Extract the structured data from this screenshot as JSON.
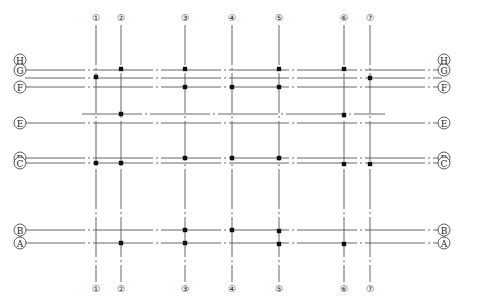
{
  "drawing": {
    "type": "structural grid axis plan",
    "colors": {
      "line": "#555555",
      "node": "#111111",
      "bubble": "#333333",
      "background": "#ffffff"
    }
  },
  "vertical_axes": [
    {
      "label": "1",
      "x": 96
    },
    {
      "label": "2",
      "x": 121
    },
    {
      "label": "3",
      "x": 185
    },
    {
      "label": "4",
      "x": 232
    },
    {
      "label": "5",
      "x": 279
    },
    {
      "label": "6",
      "x": 344
    },
    {
      "label": "7",
      "x": 370
    }
  ],
  "horizontal_axes": [
    {
      "label": "H",
      "y": 60,
      "line": false
    },
    {
      "label": "G",
      "y": 70,
      "line": true,
      "x1": 25,
      "x2": 442
    },
    {
      "label": "G'",
      "y": 78,
      "line": true,
      "x1": 25,
      "x2": 442,
      "label_hidden": true
    },
    {
      "label": "F",
      "y": 87,
      "line": true,
      "x1": 25,
      "x2": 442
    },
    {
      "label": "E'",
      "y": 114,
      "line": true,
      "x1": 82,
      "x2": 385,
      "label_hidden": true
    },
    {
      "label": "E",
      "y": 123,
      "line": true,
      "x1": 25,
      "x2": 442
    },
    {
      "label": "D",
      "y": 158,
      "line": true,
      "x1": 25,
      "x2": 442
    },
    {
      "label": "C",
      "y": 163,
      "line": true,
      "x1": 25,
      "x2": 442
    },
    {
      "label": "B",
      "y": 230,
      "line": true,
      "x1": 25,
      "x2": 442
    },
    {
      "label": "A",
      "y": 243,
      "line": true,
      "x1": 25,
      "x2": 442
    }
  ],
  "nodes": [
    {
      "axis_x": "2",
      "axis_y": "G",
      "x": 121,
      "y": 69
    },
    {
      "axis_x": "3",
      "axis_y": "G",
      "x": 185,
      "y": 69
    },
    {
      "axis_x": "5",
      "axis_y": "G",
      "x": 279,
      "y": 69
    },
    {
      "axis_x": "6",
      "axis_y": "G",
      "x": 344,
      "y": 69
    },
    {
      "axis_x": "1",
      "axis_y": "G'",
      "x": 96,
      "y": 77
    },
    {
      "axis_x": "7",
      "axis_y": "G'",
      "x": 370,
      "y": 78
    },
    {
      "axis_x": "3",
      "axis_y": "F",
      "x": 185,
      "y": 87
    },
    {
      "axis_x": "4",
      "axis_y": "F",
      "x": 232,
      "y": 87
    },
    {
      "axis_x": "5",
      "axis_y": "F",
      "x": 279,
      "y": 87
    },
    {
      "axis_x": "2",
      "axis_y": "E'",
      "x": 121,
      "y": 114
    },
    {
      "axis_x": "6",
      "axis_y": "E'",
      "x": 344,
      "y": 115
    },
    {
      "axis_x": "3",
      "axis_y": "D",
      "x": 185,
      "y": 158
    },
    {
      "axis_x": "4",
      "axis_y": "D",
      "x": 232,
      "y": 158
    },
    {
      "axis_x": "5",
      "axis_y": "D",
      "x": 279,
      "y": 158
    },
    {
      "axis_x": "1",
      "axis_y": "C",
      "x": 96,
      "y": 163
    },
    {
      "axis_x": "2",
      "axis_y": "C",
      "x": 121,
      "y": 163
    },
    {
      "axis_x": "6",
      "axis_y": "C",
      "x": 344,
      "y": 164
    },
    {
      "axis_x": "7",
      "axis_y": "C",
      "x": 370,
      "y": 164
    },
    {
      "axis_x": "3",
      "axis_y": "B",
      "x": 185,
      "y": 230
    },
    {
      "axis_x": "4",
      "axis_y": "B",
      "x": 232,
      "y": 230
    },
    {
      "axis_x": "5",
      "axis_y": "B",
      "x": 279,
      "y": 231
    },
    {
      "axis_x": "2",
      "axis_y": "A",
      "x": 121,
      "y": 243
    },
    {
      "axis_x": "3",
      "axis_y": "A",
      "x": 185,
      "y": 243
    },
    {
      "axis_x": "5",
      "axis_y": "A",
      "x": 279,
      "y": 244
    },
    {
      "axis_x": "6",
      "axis_y": "A",
      "x": 344,
      "y": 244
    }
  ],
  "layout": {
    "top_bubble_y": 18,
    "bottom_bubble_y": 289,
    "vline_y1": 25,
    "vline_y2": 282,
    "left_bubble_x": 20,
    "right_bubble_x": 444,
    "bubble_r": 6
  }
}
